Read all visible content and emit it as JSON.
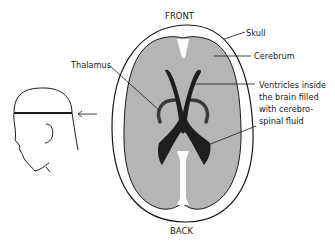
{
  "diagram": {
    "type": "anatomical-cross-section",
    "orientation": {
      "front_label": "FRONT",
      "back_label": "BACK"
    },
    "labels": {
      "skull": "Skull",
      "cerebrum": "Cerebrum",
      "thalamus": "Thalamus",
      "ventricles_line1": "Ventricles inside",
      "ventricles_line2": "the brain filled",
      "ventricles_line3": "with cerebro-",
      "ventricles_line4": "spinal fluid"
    },
    "inset": {
      "description": "Side view of head showing section plane",
      "arrow": "left-arrow"
    },
    "colors": {
      "background": "#ffffff",
      "skull_fill": "#ffffff",
      "cerebrum_fill": "#b5b5b5",
      "ventricles_fill": "#1e1e1e",
      "thalamus_stroke": "#3a3a3a",
      "outline": "#1a1a1a"
    }
  }
}
